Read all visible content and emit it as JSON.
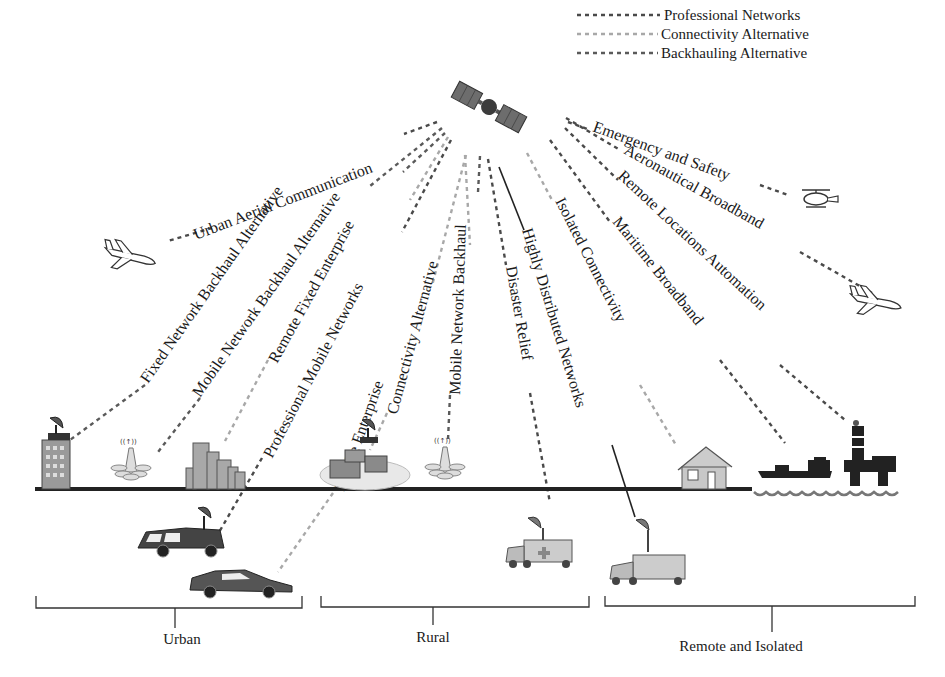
{
  "legend": [
    {
      "label": "Professional Networks",
      "style": "dark",
      "color": "#4a4a4a"
    },
    {
      "label": "Connectivity Alternative",
      "style": "light",
      "color": "#a8a8a8"
    },
    {
      "label": "Backhauling Alternative",
      "style": "mid",
      "color": "#5a5a5a"
    }
  ],
  "links": [
    {
      "label": "Urban Aerial Communication",
      "style": "dark"
    },
    {
      "label": "Fixed Network Backhaul Alternative",
      "style": "mid"
    },
    {
      "label": "Mobile Network Backhaul Alternative",
      "style": "mid"
    },
    {
      "label": "Remote Fixed Enterprise",
      "style": "light"
    },
    {
      "label": "Professional Mobile Networks",
      "style": "dark"
    },
    {
      "label": "Mobile Enterprise",
      "style": "light"
    },
    {
      "label": "Connectivity Alternative",
      "style": "light"
    },
    {
      "label": "Mobile Network Backhaul",
      "style": "mid"
    },
    {
      "label": "Disaster Relief",
      "style": "dark"
    },
    {
      "label": "Highly Distributed Networks",
      "style": "solid"
    },
    {
      "label": "Isolated Connectivity",
      "style": "light"
    },
    {
      "label": "Maritime Broadband",
      "style": "dark"
    },
    {
      "label": "Remote Locations Automation",
      "style": "dark"
    },
    {
      "label": "Aeronautical Broadband",
      "style": "dark"
    },
    {
      "label": "Emergency and Safety",
      "style": "dark"
    }
  ],
  "icons": {
    "satellite": "satellite-icon",
    "airplane_left": "airplane-icon",
    "airplane_right": "airplane-icon",
    "helicopter": "helicopter-icon",
    "office_building": "office-building-dish-icon",
    "cell_tower_urban": "cell-tower-icon",
    "city_buildings": "city-buildings-icon",
    "rural_village": "rural-village-dish-icon",
    "cell_tower_rural": "cell-tower-icon",
    "house": "house-icon",
    "ship": "ship-icon",
    "oil_rig": "oil-rig-icon",
    "van": "van-dish-icon",
    "sports_car": "sports-car-icon",
    "ambulance_truck": "ambulance-truck-dish-icon",
    "truck": "truck-dish-icon"
  },
  "regions": [
    {
      "label": "Urban"
    },
    {
      "label": "Rural"
    },
    {
      "label": "Remote and Isolated"
    }
  ]
}
